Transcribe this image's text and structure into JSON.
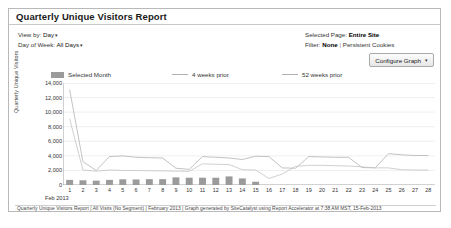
{
  "report": {
    "title": "Quarterly Unique Visitors Report",
    "controls": {
      "view_by_label": "View by:",
      "view_by_value": "Day",
      "day_of_week_label": "Day of Week:",
      "day_of_week_value": "All Days",
      "caret": "▾"
    },
    "info": {
      "selected_page_label": "Selected Page:",
      "selected_page_value": "Entire Site",
      "filter_label": "Filter:",
      "filter_value": "None",
      "filter_separator": "|",
      "filter_extra": "Persistent Cookies"
    },
    "configure_button": {
      "label": "Configure Graph",
      "caret": "▾"
    },
    "footer": "Quarterly Unique Visitors Report | All Visits (No Segment) | February 2013 | Graph generated by SiteCatalyst using Report Accelerator at 7:38 AM MST, 15-Feb-2013"
  },
  "colors": {
    "bar": "#9b9b9b",
    "line_4wk": "#b4b4b4",
    "line_52wk": "#c4c4c4",
    "axis": "#8c8c8c",
    "grid": "#e4e4e4",
    "panel_border": "#b9b9b9"
  },
  "chart_data": {
    "type": "bar",
    "title": "Quarterly Unique Visitors Report",
    "xlabel": "Feb 2013",
    "ylabel": "Quarterly Unique Visitors",
    "ylim": [
      0,
      14000
    ],
    "yticks": [
      0,
      2000,
      4000,
      6000,
      8000,
      10000,
      12000,
      14000
    ],
    "ytick_labels": [
      "0",
      "2,000",
      "4,000",
      "6,000",
      "8,000",
      "10,000",
      "12,000",
      "14,000"
    ],
    "grid": true,
    "legend_position": "top",
    "categories": [
      1,
      2,
      3,
      4,
      5,
      6,
      7,
      8,
      9,
      10,
      11,
      12,
      13,
      14,
      15,
      16,
      17,
      18,
      19,
      20,
      21,
      22,
      23,
      24,
      25,
      26,
      27,
      28
    ],
    "xtick_labels": [
      "1",
      "2",
      "3",
      "4",
      "5",
      "6",
      "7",
      "8",
      "9",
      "10",
      "11",
      "12",
      "13",
      "14",
      "15",
      "16",
      "17",
      "18",
      "19",
      "20",
      "21",
      "22",
      "23",
      "24",
      "25",
      "26",
      "27",
      "28"
    ],
    "series": [
      {
        "name": "Selected Month",
        "type": "bar",
        "values": [
          700,
          650,
          600,
          700,
          780,
          760,
          800,
          800,
          1050,
          1000,
          1000,
          1000,
          1180,
          900,
          450,
          0,
          0,
          0,
          0,
          0,
          0,
          0,
          0,
          0,
          0,
          0,
          0,
          0
        ]
      },
      {
        "name": "4 weeks prior",
        "type": "line",
        "values": [
          13100,
          3200,
          2000,
          3900,
          4000,
          3800,
          3750,
          3700,
          2300,
          2150,
          3900,
          3800,
          3700,
          3500,
          3950,
          3900,
          2350,
          2300,
          3900,
          3850,
          3800,
          3800,
          2400,
          2350,
          4300,
          4150,
          4050,
          4050
        ]
      },
      {
        "name": "52 weeks prior",
        "type": "line",
        "values": [
          9100,
          2050,
          1900,
          2050,
          2000,
          1980,
          1960,
          1940,
          1900,
          1880,
          2900,
          2850,
          2800,
          2100,
          2050,
          900,
          1500,
          2550,
          2700,
          2700,
          2650,
          2600,
          2500,
          2350,
          2350,
          2100,
          2050,
          2050
        ]
      }
    ]
  }
}
